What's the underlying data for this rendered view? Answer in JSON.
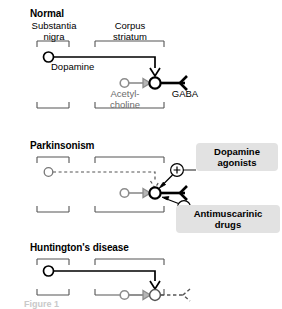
{
  "figure": {
    "caption_partial": "Figure 1"
  },
  "colors": {
    "black": "#000000",
    "gray_neuron": "#8c8c8c",
    "bracket_gray": "#555555",
    "drug_box_bg": "#e2e2e2",
    "background": "#ffffff"
  },
  "panels": [
    {
      "id": "normal",
      "title": "Normal",
      "regions": [
        {
          "id": "substantia-nigra",
          "line1": "Substantia",
          "line2": "nigra"
        },
        {
          "id": "corpus-striatum",
          "line1": "Corpus",
          "line2": "striatum"
        }
      ],
      "neurotransmitters": [
        {
          "id": "dopamine",
          "line1": "Dopamine",
          "line2": "",
          "style": "black"
        },
        {
          "id": "acetylcholine",
          "line1": "Acetyl-",
          "line2": "choline",
          "style": "gray"
        },
        {
          "id": "gaba",
          "line1": "GABA",
          "line2": "",
          "style": "black"
        }
      ]
    },
    {
      "id": "parkinsonism",
      "title": "Parkinsonism",
      "regions": [
        {
          "id": "substantia-nigra",
          "line1": "",
          "line2": ""
        },
        {
          "id": "corpus-striatum",
          "line1": "",
          "line2": ""
        }
      ],
      "modulators": [
        {
          "id": "dopamine-agonists",
          "sign": "+",
          "label_line1": "Dopamine",
          "label_line2": "agonists"
        },
        {
          "id": "antimuscarinic-drugs",
          "sign": "−",
          "label_line1": "Antimuscarinic",
          "label_line2": "drugs"
        }
      ]
    },
    {
      "id": "huntingtons",
      "title": "Huntington's disease",
      "regions": [
        {
          "id": "substantia-nigra",
          "line1": "",
          "line2": ""
        },
        {
          "id": "corpus-striatum",
          "line1": "",
          "line2": ""
        }
      ]
    }
  ]
}
